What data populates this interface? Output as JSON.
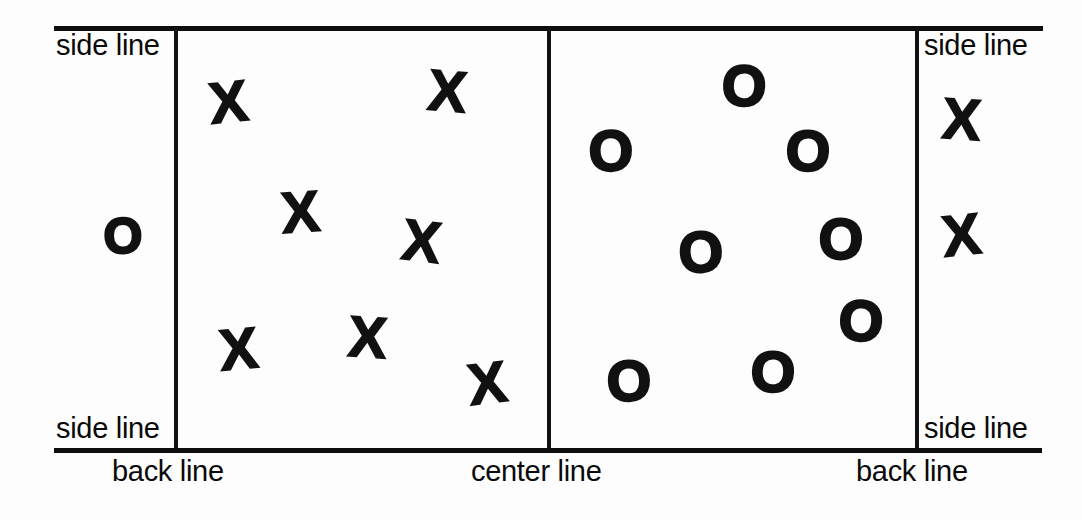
{
  "diagram": {
    "ink_color": "#111111",
    "paper_color": "#fdfdfd"
  },
  "labels": {
    "side_line_top_left": "side line",
    "side_line_bottom_left": "side line",
    "side_line_top_right": "side line",
    "side_line_bottom_right": "side line",
    "back_line_left": "back line",
    "center_line": "center line",
    "back_line_right": "back line"
  },
  "lines": {
    "top_boundary": {
      "x": 54,
      "y": 26,
      "w": 989,
      "h": 5
    },
    "bottom_boundary": {
      "x": 54,
      "y": 448,
      "w": 988,
      "h": 5
    },
    "left_side_line": {
      "x": 174,
      "y": 28,
      "w": 4,
      "h": 422
    },
    "center_line": {
      "x": 547,
      "y": 28,
      "w": 4,
      "h": 422
    },
    "right_side_line": {
      "x": 915,
      "y": 28,
      "w": 4,
      "h": 422
    }
  },
  "marks": {
    "left_court_x": [
      {
        "glyph": "X",
        "x": 228,
        "y": 103
      },
      {
        "glyph": "X",
        "x": 447,
        "y": 92
      },
      {
        "glyph": "X",
        "x": 300,
        "y": 213
      },
      {
        "glyph": "X",
        "x": 421,
        "y": 242
      },
      {
        "glyph": "X",
        "x": 238,
        "y": 350
      },
      {
        "glyph": "X",
        "x": 367,
        "y": 338
      },
      {
        "glyph": "X",
        "x": 487,
        "y": 384
      }
    ],
    "right_court_o": [
      {
        "glyph": "O",
        "x": 744,
        "y": 87
      },
      {
        "glyph": "O",
        "x": 611,
        "y": 152
      },
      {
        "glyph": "O",
        "x": 808,
        "y": 152
      },
      {
        "glyph": "O",
        "x": 701,
        "y": 253
      },
      {
        "glyph": "O",
        "x": 841,
        "y": 240
      },
      {
        "glyph": "O",
        "x": 861,
        "y": 322
      },
      {
        "glyph": "O",
        "x": 629,
        "y": 382
      },
      {
        "glyph": "O",
        "x": 773,
        "y": 373
      }
    ],
    "outside_left_o": [
      {
        "glyph": "O",
        "x": 123,
        "y": 236
      }
    ],
    "outside_right_x": [
      {
        "glyph": "X",
        "x": 961,
        "y": 120
      },
      {
        "glyph": "X",
        "x": 961,
        "y": 236
      }
    ]
  }
}
